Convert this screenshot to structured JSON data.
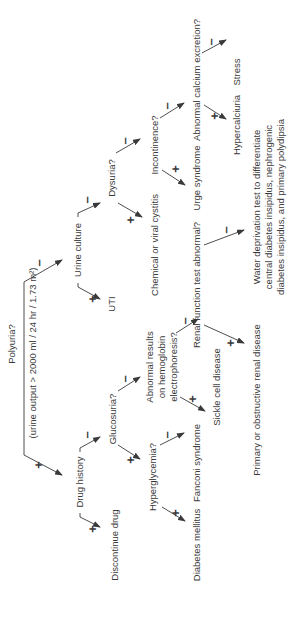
{
  "diagram": {
    "title": "Polyuria?",
    "subtitle": "(urine output > 2000 ml / 24 hr / 1.73 m²)",
    "nodes": {
      "polyuria": "Polyuria?",
      "polyuria_sub": "(urine output > 2000 ml / 24 hr / 1.73 m²)",
      "urine_culture": "Urine culture",
      "drug_history": "Drug history",
      "uti": "UTI",
      "dysuria": "Dysuria?",
      "discontinue_drug": "Discontinue drug",
      "glucosuria": "Glucosuria?",
      "cystitis": "Chemical or viral cystitis",
      "incontinence": "Incontinence?",
      "hyperglycemia": "Hyperglycemia?",
      "hemoglobin_1": "Abnormal results",
      "hemoglobin_2": "on hemoglobin",
      "hemoglobin_3": "electrophoresis?",
      "urge_syndrome": "Urge syndrome",
      "calcium": "Abnormal calcium excretion?",
      "renal_test": "Renal function test abnormal?",
      "sickle_cell": "Sickle cell disease",
      "fanconi": "Fanconi syndrome",
      "diabetes_mellitus": "Diabetes mellitus",
      "stress": "Stress",
      "hypercalciuria": "Hypercalciuria",
      "water_1": "Water deprivation test to differentiate",
      "water_2": "central diabetes insipidus, nephrogenic",
      "water_3": "diabetes insipidus, and primary polydipsia",
      "renal_disease": "Primary or obstructive renal disease"
    },
    "signs": {
      "positive": "+",
      "negative": "–"
    },
    "orientation": "rotated -90deg",
    "colors": {
      "text": "#3a3a3a",
      "lines": "#3a3a3a",
      "background": "#ffffff"
    }
  }
}
